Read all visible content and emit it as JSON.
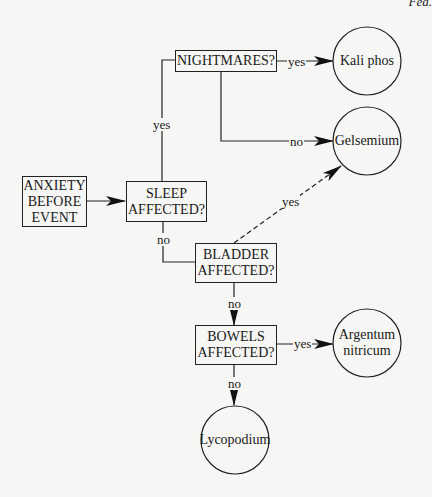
{
  "page": {
    "header_fragment": "Fea."
  },
  "nodes": {
    "anxiety": {
      "type": "start-box",
      "lines": [
        "ANXIETY",
        "BEFORE",
        "EVENT"
      ]
    },
    "sleep": {
      "type": "question-box",
      "lines": [
        "SLEEP",
        "AFFECTED?"
      ]
    },
    "nightmares": {
      "type": "question-box",
      "lines": [
        "NIGHTMARES?"
      ]
    },
    "bladder": {
      "type": "question-box",
      "lines": [
        "BLADDER",
        "AFFECTED?"
      ]
    },
    "bowels": {
      "type": "question-box",
      "lines": [
        "BOWELS",
        "AFFECTED?"
      ]
    },
    "kali_phos": {
      "type": "remedy-circle",
      "lines": [
        "Kali phos"
      ]
    },
    "gelsemium": {
      "type": "remedy-circle",
      "lines": [
        "Gelsemium"
      ]
    },
    "argentum": {
      "type": "remedy-circle",
      "lines": [
        "Argentum",
        "nitricum"
      ]
    },
    "lycopodium": {
      "type": "remedy-circle",
      "lines": [
        "Lycopodium"
      ]
    }
  },
  "edges": [
    {
      "from": "anxiety",
      "to": "sleep",
      "label": "",
      "style": "solid"
    },
    {
      "from": "sleep",
      "to": "nightmares",
      "label": "yes",
      "style": "solid"
    },
    {
      "from": "nightmares",
      "to": "kali_phos",
      "label": "yes",
      "style": "solid"
    },
    {
      "from": "nightmares",
      "to": "gelsemium",
      "label": "no",
      "style": "solid"
    },
    {
      "from": "sleep",
      "to": "bladder",
      "label": "no",
      "style": "solid"
    },
    {
      "from": "bladder",
      "to": "gelsemium",
      "label": "yes",
      "style": "dashed"
    },
    {
      "from": "bladder",
      "to": "bowels",
      "label": "no",
      "style": "solid"
    },
    {
      "from": "bowels",
      "to": "argentum",
      "label": "yes",
      "style": "solid"
    },
    {
      "from": "bowels",
      "to": "lycopodium",
      "label": "no",
      "style": "solid"
    }
  ],
  "edge_labels": {
    "sleep_yes": "yes",
    "nightmares_yes": "yes",
    "nightmares_no": "no",
    "sleep_no": "no",
    "bladder_yes": "yes",
    "bladder_no": "no",
    "bowels_yes": "yes",
    "bowels_no": "no"
  },
  "colors": {
    "background": "#f6f6f4",
    "ink": "#1a1a1a"
  }
}
